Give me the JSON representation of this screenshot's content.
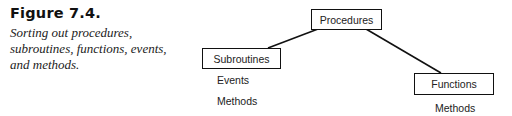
{
  "figure": {
    "label": "Figure 7.4.",
    "caption": "Sorting out procedures, subroutines, functions, events, and methods."
  },
  "diagram": {
    "root": {
      "label": "Procedures"
    },
    "left": {
      "label": "Subroutines",
      "children": [
        "Events",
        "Methods"
      ]
    },
    "right": {
      "label": "Functions",
      "children": [
        "Methods"
      ]
    }
  }
}
